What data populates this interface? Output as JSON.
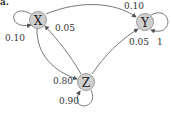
{
  "panel_label": "a.",
  "colors": {
    "node_fill": "#cfcfcf",
    "node_stroke": "#888888",
    "edge": "#555555",
    "text": "#333333"
  },
  "nodes": [
    {
      "id": "X",
      "label": "X"
    },
    {
      "id": "Y",
      "label": "Y"
    },
    {
      "id": "Z",
      "label": "Z"
    }
  ],
  "edges": [
    {
      "from": "X",
      "to": "X",
      "label": "0.10"
    },
    {
      "from": "X",
      "to": "Y",
      "label": "0.10"
    },
    {
      "from": "X",
      "to": "Z",
      "label": "0.80"
    },
    {
      "from": "Y",
      "to": "Y",
      "label": "1"
    },
    {
      "from": "Z",
      "to": "X",
      "label": "0.05"
    },
    {
      "from": "Z",
      "to": "Y",
      "label": "0.05"
    },
    {
      "from": "Z",
      "to": "Z",
      "label": "0.90"
    }
  ]
}
